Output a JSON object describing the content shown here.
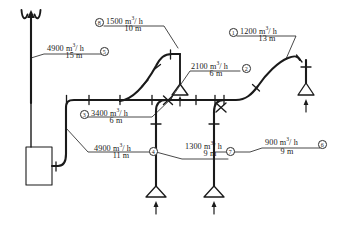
{
  "diagram": {
    "units": {
      "flow": "m3/h",
      "length": "m"
    },
    "colors": {
      "line": "#1a1a1a",
      "text": "#1a1a1a",
      "background": "#ffffff"
    },
    "branches": [
      {
        "id": "1",
        "tag": "1",
        "flow": "1200 m",
        "exp": "3",
        "flow_tail": "/ h",
        "length": "13 m"
      },
      {
        "id": "2",
        "tag": "2",
        "flow": "2100 m",
        "exp": "3",
        "flow_tail": "/ h",
        "length": "6 m"
      },
      {
        "id": "3",
        "tag": "3",
        "flow": "3400 m",
        "exp": "3",
        "flow_tail": "/ h",
        "length": "6 m"
      },
      {
        "id": "4",
        "tag": "4",
        "flow": "4900 m",
        "exp": "3",
        "flow_tail": "/ h",
        "length": "11 m"
      },
      {
        "id": "5",
        "tag": "5",
        "flow": "4900 m",
        "exp": "3",
        "flow_tail": "/ h",
        "length": "15 m"
      },
      {
        "id": "6",
        "tag": "6",
        "flow": "900 m",
        "exp": "3",
        "flow_tail": "/ h",
        "length": "9 m"
      },
      {
        "id": "7",
        "tag": "7",
        "flow": "1300 m",
        "exp": "3",
        "flow_tail": "/ h",
        "length": "9 m"
      },
      {
        "id": "8",
        "tag": "8",
        "flow": "1500 m",
        "exp": "3",
        "flow_tail": "/ h",
        "length": "10 m"
      }
    ],
    "components": {
      "stack": "exhaust-stack",
      "fan": "fan-unit-box",
      "hoods": [
        "hood-left-upper",
        "hood-lower-left",
        "hood-lower-mid",
        "hood-right"
      ]
    }
  }
}
